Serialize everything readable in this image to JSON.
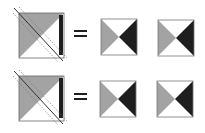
{
  "diagram": {
    "colors": {
      "background": "#ffffff",
      "gray": "#a3a3a3",
      "black": "#1e1e1e",
      "outline": "#555555",
      "dashed": "#777777"
    },
    "rows": [
      {
        "source": {
          "x": 19,
          "y": 13,
          "size": 45
        },
        "equals": "=",
        "results": [
          {
            "x": 101,
            "y": 19,
            "size": 36
          },
          {
            "x": 158,
            "y": 20,
            "size": 36
          }
        ]
      },
      {
        "source": {
          "x": 19,
          "y": 76,
          "size": 45
        },
        "equals": "=",
        "results": [
          {
            "x": 100,
            "y": 81,
            "size": 36
          },
          {
            "x": 157,
            "y": 81,
            "size": 36
          }
        ]
      }
    ]
  }
}
